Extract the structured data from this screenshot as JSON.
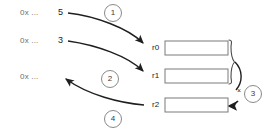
{
  "diagram": {
    "colors": {
      "memory_text": "#6e6e6e",
      "value_text": "#1a1a1a",
      "stroke": "#222222",
      "box_border": "#7a7a7a",
      "circle_border": "#8a8a8a"
    },
    "memory_cells": [
      {
        "address": "0x ...",
        "x": 20,
        "y": 13
      },
      {
        "address": "0x ...",
        "x": 20,
        "y": 41
      },
      {
        "address": "0x ...",
        "x": 20,
        "y": 77
      }
    ],
    "values": [
      {
        "text": "5",
        "x": 58,
        "y": 13
      },
      {
        "text": "3",
        "x": 58,
        "y": 41
      }
    ],
    "registers": [
      {
        "name": "r0",
        "x": 152,
        "y": 48,
        "box_x": 165,
        "box_y": 41,
        "box_w": 63,
        "box_h": 14,
        "value": ""
      },
      {
        "name": "r1",
        "x": 152,
        "y": 76,
        "box_x": 165,
        "box_y": 69,
        "box_w": 63,
        "box_h": 14,
        "value": ""
      },
      {
        "name": "r2",
        "x": 152,
        "y": 105,
        "box_x": 165,
        "box_y": 98,
        "box_w": 63,
        "box_h": 14,
        "value": ""
      }
    ],
    "steps": [
      {
        "label": "1",
        "x": 113,
        "y": 13
      },
      {
        "label": "2",
        "x": 110,
        "y": 79
      },
      {
        "label": "3",
        "x": 253,
        "y": 94
      },
      {
        "label": "4",
        "x": 113,
        "y": 119
      }
    ],
    "operator": {
      "symbol": "×",
      "x": 239,
      "y": 92
    },
    "brace": {
      "label": "group-r0-r1",
      "x": 231,
      "top": 40,
      "bottom": 85
    }
  }
}
